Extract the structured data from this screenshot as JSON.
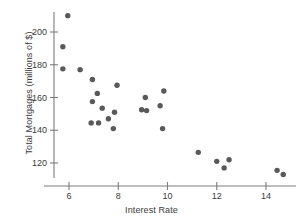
{
  "chart_data": {
    "type": "scatter",
    "title": "",
    "xlabel": "Interest Rate",
    "ylabel": "Total Mortgages (millions of $)",
    "xlim": [
      5.2,
      15.0
    ],
    "ylim": [
      112,
      214
    ],
    "xticks": [
      6,
      8,
      10,
      12,
      14
    ],
    "xtick_labels": [
      "6",
      "8",
      "10",
      "12",
      "14"
    ],
    "yticks": [
      120,
      140,
      160,
      180,
      200
    ],
    "ytick_labels": [
      "120",
      "140",
      "160",
      "180",
      "200"
    ],
    "grid": false,
    "legend": null,
    "marker": "circle",
    "marker_color": "#595959",
    "points": [
      {
        "x": 5.95,
        "y": 210.0
      },
      {
        "x": 5.75,
        "y": 191.0
      },
      {
        "x": 5.75,
        "y": 177.5
      },
      {
        "x": 6.45,
        "y": 177.0
      },
      {
        "x": 6.95,
        "y": 171.0
      },
      {
        "x": 7.15,
        "y": 162.5
      },
      {
        "x": 6.95,
        "y": 157.5
      },
      {
        "x": 7.35,
        "y": 153.5
      },
      {
        "x": 7.95,
        "y": 167.5
      },
      {
        "x": 7.85,
        "y": 151.0
      },
      {
        "x": 7.6,
        "y": 147.0
      },
      {
        "x": 6.9,
        "y": 144.5
      },
      {
        "x": 7.2,
        "y": 144.5
      },
      {
        "x": 7.8,
        "y": 141.0
      },
      {
        "x": 9.1,
        "y": 160.0
      },
      {
        "x": 8.95,
        "y": 152.5
      },
      {
        "x": 9.15,
        "y": 152.0
      },
      {
        "x": 9.85,
        "y": 164.0
      },
      {
        "x": 9.7,
        "y": 155.0
      },
      {
        "x": 9.8,
        "y": 141.0
      },
      {
        "x": 11.25,
        "y": 126.5
      },
      {
        "x": 12.0,
        "y": 121.0
      },
      {
        "x": 12.5,
        "y": 122.0
      },
      {
        "x": 12.3,
        "y": 117.0
      },
      {
        "x": 14.45,
        "y": 115.5
      },
      {
        "x": 14.7,
        "y": 113.0
      }
    ]
  }
}
